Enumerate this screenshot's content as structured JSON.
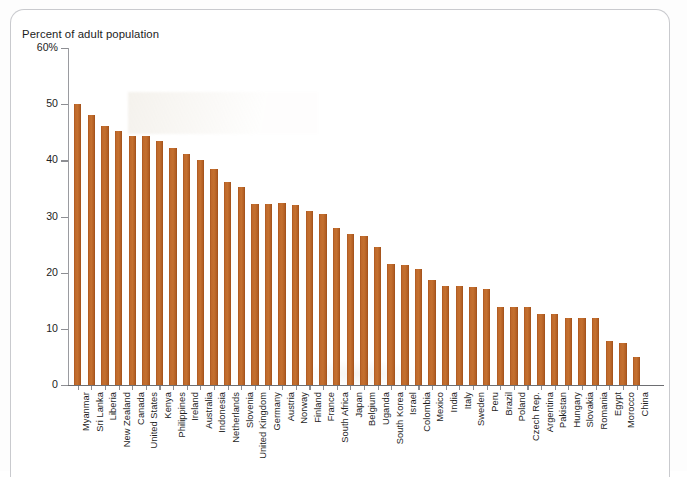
{
  "chart_data": {
    "type": "bar",
    "title": "Percent of adult population",
    "xlabel": "",
    "ylabel": "",
    "ylim": [
      0,
      60
    ],
    "yticks": [
      0,
      10,
      20,
      30,
      40,
      50,
      60
    ],
    "ytick_labels": [
      "0",
      "10",
      "20",
      "30",
      "40",
      "50",
      "60%"
    ],
    "grid": false,
    "legend": null,
    "bar_color": "#c0692a",
    "categories": [
      "Myanmar",
      "Sri Lanka",
      "Liberia",
      "New Zealand",
      "Canada",
      "United States",
      "Kenya",
      "Philippines",
      "Ireland",
      "Australia",
      "Indonesia",
      "Netherlands",
      "Slovenia",
      "United Kingdom",
      "Germany",
      "Austria",
      "Norway",
      "Finland",
      "France",
      "South Africa",
      "Japan",
      "Belgium",
      "Uganda",
      "South Korea",
      "Israel",
      "Colombia",
      "Mexico",
      "India",
      "Italy",
      "Sweden",
      "Peru",
      "Brazil",
      "Poland",
      "Czech Rep.",
      "Argentina",
      "Pakistan",
      "Hungary",
      "Slovakia",
      "Romania",
      "Egypt",
      "Morocco",
      "China"
    ],
    "values": [
      50.0,
      48.0,
      46.2,
      45.2,
      44.3,
      44.3,
      43.4,
      42.2,
      41.2,
      40.0,
      38.4,
      36.2,
      35.2,
      32.3,
      32.3,
      32.4,
      32.1,
      31.0,
      30.5,
      28.0,
      26.9,
      26.6,
      24.6,
      21.6,
      21.4,
      20.6,
      18.7,
      17.7,
      17.6,
      17.5,
      17.1,
      13.9,
      13.9,
      13.8,
      12.7,
      12.6,
      11.9,
      11.9,
      11.9,
      7.9,
      7.4,
      5.0
    ]
  }
}
